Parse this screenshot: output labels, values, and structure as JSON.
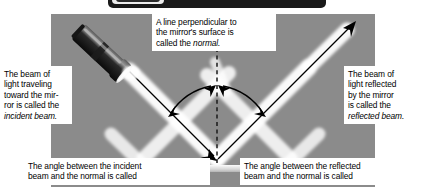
{
  "figure": {
    "background_color": "#8b8b8b",
    "beam_color": "#ffffff",
    "line_color": "#000000",
    "caption_bg": "#ffffff",
    "header_bar_color": "#1a1a1a"
  },
  "captions": {
    "normal": {
      "line1": "A line perpendicular to",
      "line2": "the mirror's surface is",
      "line3_plain": "called the ",
      "line3_italic": "normal."
    },
    "incident_beam": {
      "line1": "The beam of",
      "line2": "light traveling",
      "line3": "toward the mir-",
      "line4": "ror is called the",
      "line5_italic": "incident beam."
    },
    "reflected_beam": {
      "line1": "The beam of",
      "line2": "light reflected",
      "line3": "by the mirror",
      "line4": "is called the",
      "line5_italic": "reflected beam."
    },
    "angle_of_incidence": {
      "line1": "The angle between the incident",
      "line2": "beam and the normal is called"
    },
    "angle_of_reflection": {
      "line1": "The angle between the reflected",
      "line2": "beam and the normal is called"
    }
  },
  "elements": {
    "flashlight": "flashlight-icon",
    "normal_line": "dashed-normal-line",
    "incident_beam": "incident-beam-arrow",
    "reflected_beam": "reflected-beam-arrow",
    "mirror": "mirror-surface",
    "angle_arc_incidence": "angle-arc-incidence",
    "angle_arc_reflection": "angle-arc-reflection"
  }
}
